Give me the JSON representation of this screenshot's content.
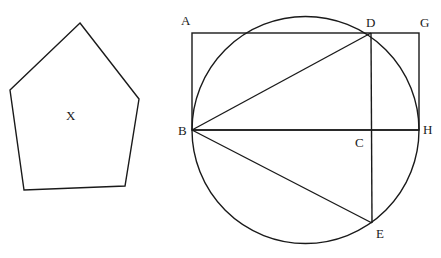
{
  "diagram": {
    "pentagon": {
      "label": "X",
      "points": "80,23 139,99 125,186 24,190 10,90",
      "label_pos": [
        71,
        119
      ]
    },
    "circle": {
      "cx": 305.5,
      "cy": 130,
      "r": 113.5
    },
    "rectangle": {
      "x": 192,
      "y": 33,
      "width": 227,
      "height": 97
    },
    "points": {
      "A": {
        "label": "A",
        "label_pos": [
          182,
          24
        ]
      },
      "B": {
        "label": "B",
        "label_pos": [
          178,
          134
        ]
      },
      "C": {
        "label": "C",
        "label_pos": [
          356,
          147
        ]
      },
      "D": {
        "label": "D",
        "label_pos": [
          366,
          25
        ]
      },
      "E": {
        "label": "E",
        "label_pos": [
          375,
          237
        ]
      },
      "G": {
        "label": "G",
        "label_pos": [
          420,
          25
        ]
      },
      "H": {
        "label": "H",
        "label_pos": [
          422,
          134
        ]
      }
    },
    "segments": [
      {
        "name": "BD",
        "x1": 192,
        "y1": 130,
        "x2": 371,
        "y2": 33
      },
      {
        "name": "BH",
        "x1": 192,
        "y1": 130,
        "x2": 419,
        "y2": 130
      },
      {
        "name": "BE",
        "x1": 192,
        "y1": 130,
        "x2": 372,
        "y2": 223
      },
      {
        "name": "DE",
        "x1": 371,
        "y1": 33,
        "x2": 372,
        "y2": 223
      }
    ]
  }
}
